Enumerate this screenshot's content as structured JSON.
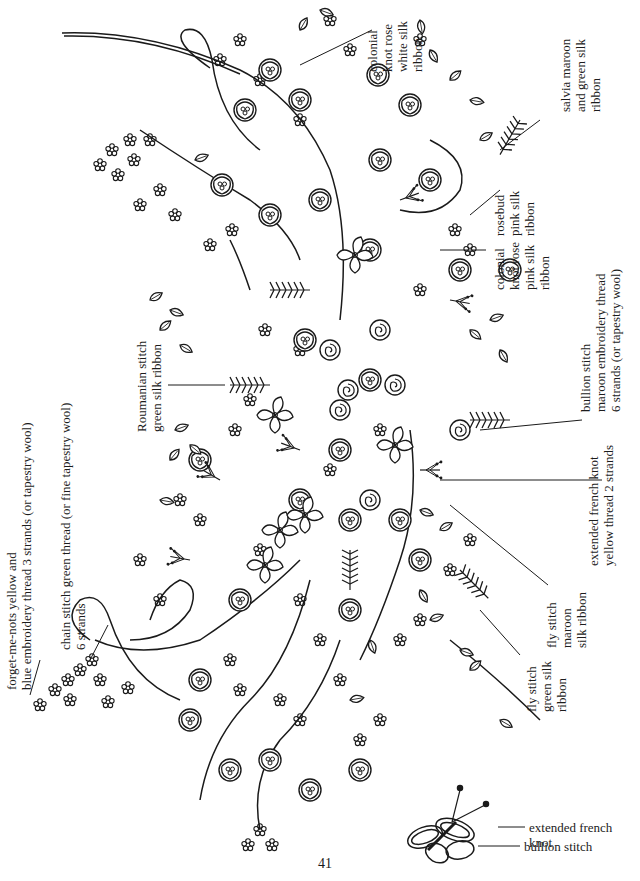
{
  "page": {
    "page_number": "41",
    "background": "#ffffff",
    "ink_color": "#1a1a1a"
  },
  "labels": {
    "colonial_knot_white": [
      "colonial",
      "knot rose",
      "white silk",
      "ribbon"
    ],
    "salvia": [
      "salvia maroon",
      "and green silk",
      "ribbon"
    ],
    "rosebud": [
      "rosebud",
      "pink silk",
      "ribbon"
    ],
    "colonial_knot_pink": [
      "colonial",
      "knot rose",
      "pink silk",
      "ribbon"
    ],
    "bullion_stitch_main": [
      "bullion stitch",
      "maroon embroidery thread",
      "6 strands (or tapestry wool)"
    ],
    "extended_french_knot_main": [
      "extended french knot",
      "yellow thread 2 strands"
    ],
    "fly_stitch_maroon": [
      "fly stitch",
      "maroon",
      "silk ribbon"
    ],
    "fly_stitch_green": [
      "fly stitch",
      "green silk",
      "ribbon"
    ],
    "roumanian_stitch": [
      "Roumanian stitch",
      "green silk ribbon"
    ],
    "chain_stitch": [
      "chain stitch green thread (or fine tapestry wool)",
      "6 strands"
    ],
    "forget_me_nots": [
      "forget-me-nots yellow and",
      "blue embroidery thread 3 strands (or tapestry wool)"
    ]
  },
  "butterfly_legend": {
    "extended_french_knot": [
      "extended french",
      "knot"
    ],
    "bullion_stitch": "bullion stitch"
  }
}
